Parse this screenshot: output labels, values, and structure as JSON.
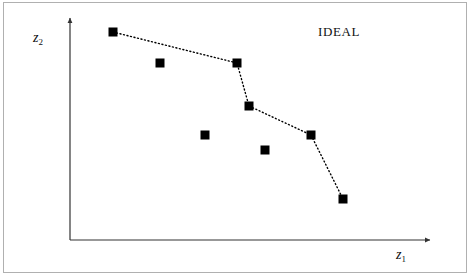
{
  "figure": {
    "width": 470,
    "height": 276,
    "background_color": "#ffffff",
    "frame_color": "#b0b0b0"
  },
  "annotations": {
    "ideal_label": "IDEAL"
  },
  "axes": {
    "x_label_base": "z",
    "x_label_sub": "1",
    "y_label_base": "z",
    "y_label_sub": "2",
    "origin_px": [
      70,
      240
    ],
    "x_axis_end_px": [
      430,
      240
    ],
    "y_axis_end_px": [
      70,
      18
    ],
    "axis_color": "#333333"
  },
  "chart_data": {
    "type": "scatter",
    "title": "",
    "subtitle": "",
    "xlabel": "z1",
    "ylabel": "z2",
    "xlim": [
      0,
      1
    ],
    "ylim": [
      0,
      1
    ],
    "grid": false,
    "legend": "none",
    "annotations": [
      {
        "text": "IDEAL",
        "x_px": 342,
        "y_px": 33
      }
    ],
    "marker": {
      "shape": "square",
      "color": "#000000",
      "size_px": 9
    },
    "connector": {
      "style": "dotted",
      "color": "#000000",
      "width_px": 1.4,
      "dash_px": [
        1,
        2.6
      ]
    },
    "series": [
      {
        "name": "ideal front (connected)",
        "connected": true,
        "points_px": [
          [
            113,
            32
          ],
          [
            237,
            63
          ],
          [
            249,
            106
          ],
          [
            311,
            135
          ],
          [
            343,
            199
          ]
        ],
        "x": [
          0.12,
          0.46,
          0.5,
          0.67,
          0.76
        ],
        "y": [
          0.94,
          0.8,
          0.6,
          0.47,
          0.18
        ]
      },
      {
        "name": "dominated points (isolated)",
        "connected": false,
        "points_px": [
          [
            160,
            63
          ],
          [
            205,
            135
          ],
          [
            265,
            150
          ]
        ],
        "x": [
          0.25,
          0.37,
          0.54
        ],
        "y": [
          0.8,
          0.47,
          0.41
        ]
      }
    ]
  }
}
